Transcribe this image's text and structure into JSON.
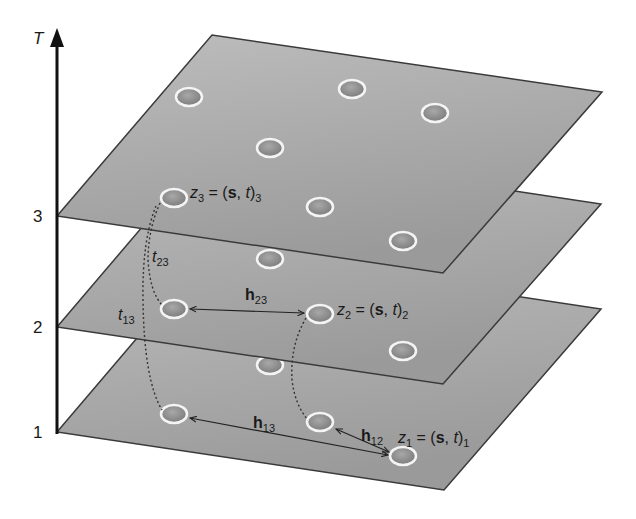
{
  "colors": {
    "plane_fill_top": "#b8b8b8",
    "plane_fill_bottom": "#9c9c9c",
    "plane_edge": "#3a3a3a",
    "point_fill": "#8e8e8e",
    "point_ring": "#f4f4f4",
    "axis": "#111111"
  },
  "axis": {
    "label": "T",
    "ticks": [
      {
        "label": "3",
        "y": 216
      },
      {
        "label": "2",
        "y": 327
      },
      {
        "label": "1",
        "y": 432
      }
    ]
  },
  "planes": [
    {
      "name": "plane-t3",
      "offset": 0
    },
    {
      "name": "plane-t2",
      "offset": 111
    },
    {
      "name": "plane-t1",
      "offset": 216
    }
  ],
  "points": {
    "plane3": [
      [
        189,
        97
      ],
      [
        352,
        89
      ],
      [
        435,
        113
      ],
      [
        270,
        148
      ],
      [
        174,
        198
      ],
      [
        320,
        207
      ],
      [
        403,
        241
      ]
    ],
    "plane2": [
      [
        270,
        259
      ],
      [
        174,
        309
      ],
      [
        320,
        314
      ],
      [
        403,
        351
      ]
    ],
    "plane1": [
      [
        270,
        365
      ],
      [
        174,
        414
      ],
      [
        320,
        422
      ],
      [
        403,
        456
      ]
    ]
  },
  "labels": {
    "z3": {
      "main": "z",
      "sub": "3",
      "rest": " = (",
      "s": "s",
      "comma": ", ",
      "t": "t",
      "close": ")",
      "sub2": "3"
    },
    "z2": {
      "main": "z",
      "sub": "2",
      "rest": " = (",
      "s": "s",
      "comma": ", ",
      "t": "t",
      "close": ")",
      "sub2": "2"
    },
    "z1": {
      "main": "z",
      "sub": "1",
      "rest": " = (",
      "s": "s",
      "comma": ", ",
      "t": "t",
      "close": ")",
      "sub2": "1"
    },
    "h23": {
      "main": "h",
      "sub": "23"
    },
    "h13": {
      "main": "h",
      "sub": "13"
    },
    "h12": {
      "main": "h",
      "sub": "12"
    },
    "t23": {
      "main": "t",
      "sub": "23"
    },
    "t13": {
      "main": "t",
      "sub": "13"
    }
  }
}
